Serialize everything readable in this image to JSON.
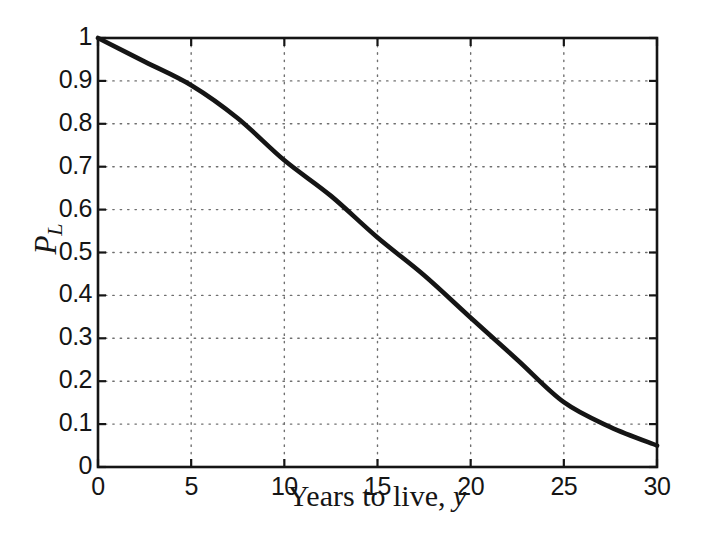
{
  "figure": {
    "background_color": "#ffffff",
    "ink_color": "#151515",
    "grid_color": "#6f6f6f"
  },
  "chart_data": {
    "type": "line",
    "title": "",
    "xlabel": "Years to live, y",
    "xlabel_parts": {
      "text": "Years to live, ",
      "variable": "y"
    },
    "ylabel": "P_L",
    "ylabel_parts": {
      "main": "P",
      "subscript": "L"
    },
    "xlim": [
      0,
      30
    ],
    "ylim": [
      0,
      1
    ],
    "grid": "dotted",
    "legend_position": "none",
    "xticks": {
      "values": [
        0,
        5,
        10,
        15,
        20,
        25,
        30
      ],
      "labels": [
        "0",
        "5",
        "10",
        "15",
        "20",
        "25",
        "30"
      ]
    },
    "yticks": {
      "values": [
        0,
        0.1,
        0.2,
        0.3,
        0.4,
        0.5,
        0.6,
        0.7,
        0.8,
        0.9,
        1
      ],
      "labels": [
        "0",
        "0.1",
        "0.2",
        "0.3",
        "0.4",
        "0.5",
        "0.6",
        "0.7",
        "0.8",
        "0.9",
        "1"
      ]
    },
    "series": [
      {
        "name": "P_L versus years to live",
        "color": "#151515",
        "line_width": 4.6,
        "x": [
          0,
          2.5,
          5,
          7.5,
          10,
          12.5,
          15,
          17.5,
          20,
          22.5,
          25,
          27.5,
          30
        ],
        "y": [
          1.0,
          0.945,
          0.89,
          0.813,
          0.715,
          0.632,
          0.535,
          0.447,
          0.348,
          0.25,
          0.151,
          0.093,
          0.05
        ]
      }
    ]
  }
}
